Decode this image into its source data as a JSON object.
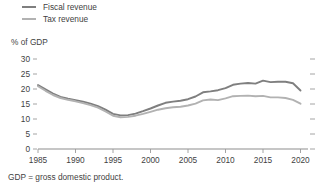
{
  "legend": {
    "position": "top-left",
    "items": [
      {
        "label": "Fiscal revenue",
        "color": "#7f7f7f",
        "key": "fiscal_revenue"
      },
      {
        "label": "Tax revenue",
        "color": "#b2b2b2",
        "key": "tax_revenue"
      }
    ]
  },
  "axis_title": "% of GDP",
  "footnote": "GDP = gross domestic product.",
  "chart_data": {
    "type": "line",
    "title": "",
    "subtitle": "",
    "xlabel": "",
    "ylabel": "% of GDP",
    "ylim": [
      0,
      30
    ],
    "xlim": [
      1985,
      2021
    ],
    "yticks": [
      0,
      5,
      10,
      15,
      20,
      25,
      30
    ],
    "xticks": [
      1985,
      1990,
      1995,
      2000,
      2005,
      2010,
      2015,
      2020
    ],
    "ytick_labels": [
      "0",
      "5",
      "10",
      "15",
      "20",
      "25",
      "30"
    ],
    "xtick_labels": [
      "1985",
      "1990",
      "1995",
      "2000",
      "2005",
      "2010",
      "2015",
      "2020"
    ],
    "grid": false,
    "legend_position": "top-left",
    "note": "GDP = gross domestic product.",
    "x": [
      1985,
      1986,
      1987,
      1988,
      1989,
      1990,
      1991,
      1992,
      1993,
      1994,
      1995,
      1996,
      1997,
      1998,
      1999,
      2000,
      2001,
      2002,
      2003,
      2004,
      2005,
      2006,
      2007,
      2008,
      2009,
      2010,
      2011,
      2012,
      2013,
      2014,
      2015,
      2016,
      2017,
      2018,
      2019,
      2020
    ],
    "series": [
      {
        "name": "Fiscal revenue",
        "color": "#7f7f7f",
        "values": [
          21.3,
          19.9,
          18.5,
          17.4,
          16.8,
          16.3,
          15.8,
          15.1,
          14.3,
          13.1,
          11.7,
          11.2,
          11.3,
          11.8,
          12.6,
          13.5,
          14.5,
          15.4,
          15.8,
          16.1,
          16.6,
          17.5,
          18.9,
          19.2,
          19.6,
          20.3,
          21.4,
          21.8,
          22.0,
          21.8,
          22.8,
          22.3,
          22.4,
          22.4,
          21.9,
          19.5
        ]
      },
      {
        "name": "Tax revenue",
        "color": "#b2b2b2",
        "values": [
          20.9,
          19.4,
          18.0,
          17.0,
          16.4,
          15.9,
          15.3,
          14.6,
          13.8,
          12.5,
          11.1,
          10.6,
          10.7,
          11.1,
          11.7,
          12.4,
          13.1,
          13.6,
          13.9,
          14.1,
          14.5,
          15.1,
          16.2,
          16.5,
          16.3,
          16.9,
          17.6,
          17.7,
          17.8,
          17.6,
          17.7,
          17.2,
          17.2,
          17.0,
          16.4,
          15.1
        ]
      }
    ]
  }
}
